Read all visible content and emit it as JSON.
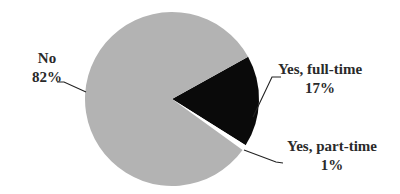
{
  "chart_data": {
    "type": "pie",
    "title": "",
    "categories": [
      "No",
      "Yes, full-time",
      "Yes, part-time"
    ],
    "values": [
      82,
      17,
      1
    ],
    "unit": "%",
    "colors": [
      "#b3b3b3",
      "#0a0a0a",
      "#ffffff"
    ],
    "labels": [
      {
        "name": "No",
        "value": "82%"
      },
      {
        "name": "Yes, full-time",
        "value": "17%"
      },
      {
        "name": "Yes, part-time",
        "value": "1%"
      }
    ],
    "legend": "none (direct labels with leader lines)"
  },
  "labels": {
    "no": {
      "name": "No",
      "value": "82%"
    },
    "full_time": {
      "name": "Yes, full-time",
      "value": "17%"
    },
    "part_time": {
      "name": "Yes, part-time",
      "value": "1%"
    }
  }
}
